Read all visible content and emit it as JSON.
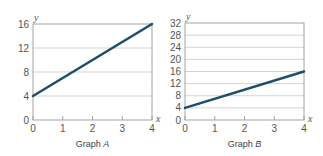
{
  "chart_data": [
    {
      "type": "line",
      "title": "Graph A",
      "caption_prefix": "Graph ",
      "caption_letter": "A",
      "xlabel": "x",
      "ylabel": "y",
      "x": [
        0,
        4
      ],
      "series": [
        {
          "name": "line",
          "values": [
            4,
            16
          ],
          "color": "#1f4e6b"
        }
      ],
      "xlim": [
        0,
        4
      ],
      "ylim": [
        0,
        16
      ],
      "xticks": [
        "0",
        "1",
        "2",
        "3",
        "4"
      ],
      "yticks": [
        "0",
        "4",
        "8",
        "12",
        "16"
      ],
      "grid": "horizontal"
    },
    {
      "type": "line",
      "title": "Graph B",
      "caption_prefix": "Graph ",
      "caption_letter": "B",
      "xlabel": "x",
      "ylabel": "y",
      "x": [
        0,
        4
      ],
      "series": [
        {
          "name": "line",
          "values": [
            4,
            16
          ],
          "color": "#1f4e6b"
        }
      ],
      "xlim": [
        0,
        4
      ],
      "ylim": [
        0,
        32
      ],
      "xticks": [
        "0",
        "1",
        "2",
        "3",
        "4"
      ],
      "yticks": [
        "0",
        "4",
        "8",
        "12",
        "16",
        "20",
        "24",
        "28",
        "32"
      ],
      "grid": "horizontal"
    }
  ]
}
